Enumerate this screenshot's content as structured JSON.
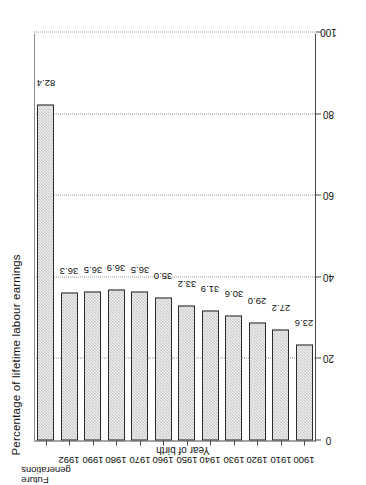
{
  "chart_data": {
    "type": "bar",
    "title": "Percentage of lifetime labour earnings",
    "xlabel": "Year of birth",
    "ylabel": "",
    "orientation": "vertical",
    "ylim": [
      0,
      100
    ],
    "yticks": [
      "0",
      "20",
      "40",
      "60",
      "80",
      "100"
    ],
    "ytick_values": [
      0,
      20,
      40,
      60,
      80,
      100
    ],
    "grid": "dotted vertical gridlines at 20, 40, 60, 80, 100",
    "legend": "none",
    "categories": [
      "1900",
      "1910",
      "1920",
      "1930",
      "1940",
      "1950",
      "1960",
      "1970",
      "1980",
      "1990",
      "1992",
      "Future generations"
    ],
    "values": [
      23.6,
      27.2,
      29.0,
      30.6,
      31.9,
      33.2,
      35.0,
      36.5,
      36.9,
      36.5,
      36.3,
      82.4
    ],
    "data_labels": [
      "23.6",
      "27.2",
      "29.0",
      "30.6",
      "31.9",
      "33.2",
      "35.0",
      "36.5",
      "36.9",
      "36.5",
      "36.3",
      "82.4"
    ],
    "bar_fill": "#c9c9c9",
    "bar_edge": "#2b2b2b",
    "axis_color": "#4a4a4a"
  }
}
